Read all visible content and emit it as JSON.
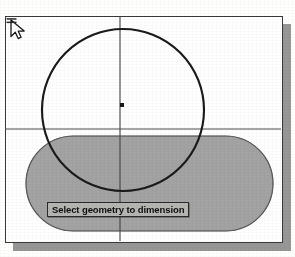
{
  "app": {
    "name": "cad-drawing-window",
    "title": "",
    "background_color": "#fdfdfc",
    "frame_color": "#3a3a3a",
    "frame_fill": "#fefefe",
    "shadow_color": "#8e8e8e"
  },
  "canvas": {
    "name": "drawing-canvas",
    "width": 275,
    "height": 224,
    "construction_lines": {
      "vertical_x": 114,
      "horizontal_y": 112,
      "color": "#4a4a4a",
      "label_vertical": "vertical-construction-line",
      "label_horizontal": "horizontal-construction-line"
    },
    "shapes": [
      {
        "id": "circle-1",
        "type": "circle",
        "name": "circle-profile",
        "cx": 117,
        "cy": 93,
        "r": 81,
        "stroke": "#1c1c1c",
        "stroke_width": 2.1,
        "fill": "none"
      },
      {
        "id": "stadium-1",
        "type": "stadium",
        "name": "slot-profile",
        "x": 20,
        "y": 119,
        "width": 247,
        "height": 95,
        "radius": 47.5,
        "fill": "#a2a2a2",
        "stroke": "#4f4f4f",
        "stroke_width": 1.2
      }
    ],
    "center_point": {
      "name": "circle-center-point",
      "x": 116,
      "y": 88,
      "size": 4,
      "color": "#1a1a1a"
    }
  },
  "cursor": {
    "name": "arrow-cursor",
    "icon": "arrow-pointer-icon",
    "x": 14,
    "y": 162,
    "fill": "#ffffff",
    "stroke": "#1a1a1a"
  },
  "tool_badge": {
    "name": "dimension-tool-badge-icon",
    "icon": "dimension-icon",
    "x": 33,
    "y": 173,
    "color": "#2c2c2c"
  },
  "tooltip": {
    "name": "status-tooltip",
    "text": "Select geometry to dimension",
    "background": "#b4b4b0",
    "border": "#2b2b2b",
    "text_color": "#101010",
    "x": 41,
    "y": 185
  },
  "colors": {
    "fill_gray": "#a2a2a2",
    "outline_dark": "#1c1c1c",
    "construction": "#4a4a4a",
    "paper": "#fdfdfc"
  }
}
